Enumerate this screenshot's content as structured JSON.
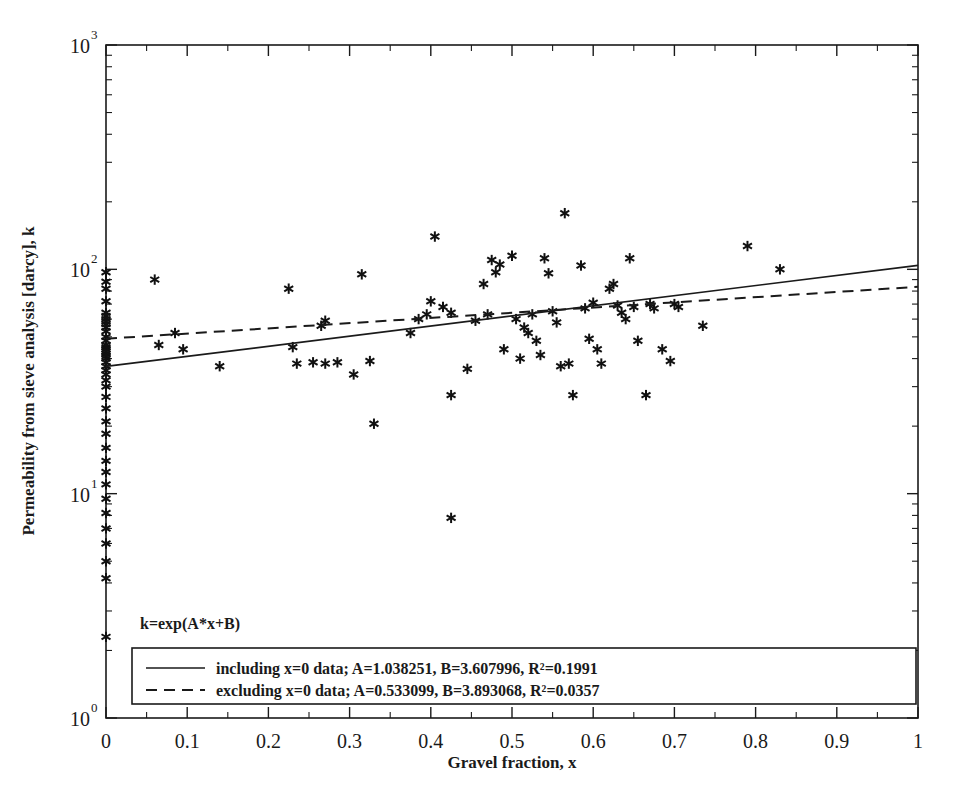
{
  "chart_data": {
    "type": "scatter",
    "title": "",
    "xlabel": "Gravel fraction, x",
    "ylabel": "Permeability from sieve analysis [darcy], k",
    "xlim": [
      0,
      1
    ],
    "ylim": [
      1,
      1000
    ],
    "yscale": "log",
    "xscale": "linear",
    "grid": false,
    "xticks": [
      "0",
      "0.1",
      "0.2",
      "0.3",
      "0.4",
      "0.5",
      "0.6",
      "0.7",
      "0.8",
      "0.9",
      "1"
    ],
    "xtick_values": [
      0,
      0.1,
      0.2,
      0.3,
      0.4,
      0.5,
      0.6,
      0.7,
      0.8,
      0.9,
      1
    ],
    "yticks": [
      "10^0",
      "10^1",
      "10^2",
      "10^3"
    ],
    "ytick_values": [
      1,
      10,
      100,
      1000
    ],
    "ytick_mantissa": "10",
    "ytick_exponents": [
      "0",
      "1",
      "2",
      "3"
    ],
    "marker_style": "asterisk",
    "marker_color": "#111111",
    "annotation": "k=exp(A*x+B)",
    "legend": {
      "position": "bottom-left-inside",
      "entries": [
        {
          "style": "solid",
          "label": "including x=0 data; A=1.038251, B=3.607996, R²=0.1991",
          "A": 1.038251,
          "B": 3.607996,
          "R2": 0.1991
        },
        {
          "style": "dashed",
          "label": "excluding x=0 data; A=0.533099, B=3.893068, R²=0.0357",
          "A": 0.533099,
          "B": 3.893068,
          "R2": 0.0357
        }
      ]
    },
    "series": [
      {
        "name": "Permeability samples",
        "points": [
          [
            0.0,
            97.0
          ],
          [
            0.0,
            88.0
          ],
          [
            0.0,
            82.0
          ],
          [
            0.0,
            72.0
          ],
          [
            0.0,
            64.0
          ],
          [
            0.0,
            62.0
          ],
          [
            0.0,
            60.0
          ],
          [
            0.0,
            58.5
          ],
          [
            0.0,
            57.0
          ],
          [
            0.0,
            55.0
          ],
          [
            0.0,
            53.0
          ],
          [
            0.0,
            50.0
          ],
          [
            0.0,
            48.0
          ],
          [
            0.0,
            46.0
          ],
          [
            0.0,
            45.0
          ],
          [
            0.0,
            44.0
          ],
          [
            0.0,
            43.0
          ],
          [
            0.0,
            42.0
          ],
          [
            0.0,
            41.0
          ],
          [
            0.0,
            40.0
          ],
          [
            0.0,
            38.5
          ],
          [
            0.0,
            37.0
          ],
          [
            0.0,
            35.5
          ],
          [
            0.0,
            34.0
          ],
          [
            0.0,
            32.0
          ],
          [
            0.0,
            30.0
          ],
          [
            0.0,
            27.0
          ],
          [
            0.0,
            24.0
          ],
          [
            0.0,
            21.0
          ],
          [
            0.0,
            18.5
          ],
          [
            0.0,
            16.0
          ],
          [
            0.0,
            14.0
          ],
          [
            0.0,
            12.5
          ],
          [
            0.0,
            11.0
          ],
          [
            0.0,
            9.5
          ],
          [
            0.0,
            8.2
          ],
          [
            0.0,
            7.0
          ],
          [
            0.0,
            6.0
          ],
          [
            0.0,
            5.0
          ],
          [
            0.0,
            4.2
          ],
          [
            0.0,
            2.3
          ],
          [
            0.06,
            90.0
          ],
          [
            0.065,
            46.0
          ],
          [
            0.085,
            52.0
          ],
          [
            0.095,
            44.0
          ],
          [
            0.14,
            37.0
          ],
          [
            0.225,
            82.0
          ],
          [
            0.23,
            45.0
          ],
          [
            0.235,
            38.0
          ],
          [
            0.255,
            38.5
          ],
          [
            0.265,
            56.0
          ],
          [
            0.27,
            59.0
          ],
          [
            0.27,
            38.0
          ],
          [
            0.285,
            38.5
          ],
          [
            0.305,
            34.0
          ],
          [
            0.315,
            95.0
          ],
          [
            0.325,
            39.0
          ],
          [
            0.33,
            20.5
          ],
          [
            0.375,
            52.0
          ],
          [
            0.385,
            60.0
          ],
          [
            0.395,
            63.0
          ],
          [
            0.4,
            72.0
          ],
          [
            0.405,
            140.0
          ],
          [
            0.415,
            68.0
          ],
          [
            0.425,
            64.0
          ],
          [
            0.425,
            27.5
          ],
          [
            0.425,
            7.8
          ],
          [
            0.445,
            36.0
          ],
          [
            0.455,
            59.0
          ],
          [
            0.465,
            86.0
          ],
          [
            0.47,
            63.0
          ],
          [
            0.475,
            110.0
          ],
          [
            0.48,
            97.0
          ],
          [
            0.485,
            105.0
          ],
          [
            0.49,
            44.0
          ],
          [
            0.5,
            115.0
          ],
          [
            0.505,
            60.0
          ],
          [
            0.51,
            40.0
          ],
          [
            0.515,
            55.0
          ],
          [
            0.52,
            52.0
          ],
          [
            0.525,
            63.0
          ],
          [
            0.53,
            48.0
          ],
          [
            0.535,
            41.5
          ],
          [
            0.54,
            112.0
          ],
          [
            0.545,
            96.0
          ],
          [
            0.55,
            65.0
          ],
          [
            0.555,
            58.0
          ],
          [
            0.56,
            37.0
          ],
          [
            0.565,
            178.0
          ],
          [
            0.57,
            38.0
          ],
          [
            0.575,
            27.5
          ],
          [
            0.585,
            104.0
          ],
          [
            0.59,
            67.0
          ],
          [
            0.595,
            49.0
          ],
          [
            0.6,
            71.0
          ],
          [
            0.605,
            44.0
          ],
          [
            0.61,
            38.0
          ],
          [
            0.62,
            82.0
          ],
          [
            0.625,
            86.0
          ],
          [
            0.63,
            69.0
          ],
          [
            0.635,
            64.0
          ],
          [
            0.64,
            60.0
          ],
          [
            0.645,
            112.0
          ],
          [
            0.65,
            68.0
          ],
          [
            0.655,
            48.0
          ],
          [
            0.665,
            27.5
          ],
          [
            0.67,
            70.0
          ],
          [
            0.675,
            67.0
          ],
          [
            0.685,
            44.0
          ],
          [
            0.695,
            39.0
          ],
          [
            0.7,
            70.0
          ],
          [
            0.705,
            68.0
          ],
          [
            0.735,
            56.0
          ],
          [
            0.79,
            127.0
          ],
          [
            0.83,
            100.0
          ]
        ]
      }
    ],
    "fit_curves": [
      {
        "name": "including x=0 data",
        "style": "solid",
        "formula": "k=exp(A*x+B)",
        "A": 1.038251,
        "B": 3.607996,
        "endpoints": [
          [
            0,
            36.9
          ],
          [
            1,
            104.2
          ]
        ]
      },
      {
        "name": "excluding x=0 data",
        "style": "dashed",
        "formula": "k=exp(A*x+B)",
        "A": 0.533099,
        "B": 3.893068,
        "endpoints": [
          [
            0,
            49.05
          ],
          [
            1,
            83.6
          ]
        ]
      }
    ]
  }
}
